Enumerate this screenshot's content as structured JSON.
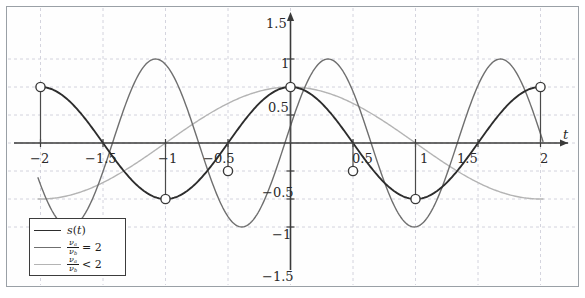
{
  "figure": {
    "background": "#ffffff",
    "frame_color": "#9aa0a6",
    "grid_color": "#c9c9d6",
    "axis_color": "#3a3a3a"
  },
  "axes": {
    "x_axis_label": "t",
    "y_axis_label": "",
    "x_ticks": [
      {
        "value": -2,
        "label": "−2"
      },
      {
        "value": -1.5,
        "label": "−1.5"
      },
      {
        "value": -1,
        "label": "−1"
      },
      {
        "value": -0.5,
        "label": "−0.5"
      },
      {
        "value": 0.5,
        "label": "0.5"
      },
      {
        "value": 1,
        "label": "1"
      },
      {
        "value": 1.5,
        "label": "1.5"
      },
      {
        "value": 2,
        "label": "2"
      }
    ],
    "y_ticks": [
      {
        "value": 1.5,
        "label": "1.5"
      },
      {
        "value": 1,
        "label": "1"
      },
      {
        "value": 0.5,
        "label": "0.5"
      },
      {
        "value": -0.5,
        "label": "−0.5"
      },
      {
        "value": -1,
        "label": "−1"
      },
      {
        "value": -1.5,
        "label": "−1.5"
      }
    ]
  },
  "legend": {
    "position": "bottom-left",
    "entries": [
      {
        "label": "s(t)",
        "kind": "italic",
        "color": "#2d2d2d",
        "width": 1.9
      },
      {
        "label": "ν_a/ν_b = 2",
        "kind": "fraction",
        "numerator": "ν",
        "num_sub": "a",
        "denominator": "ν",
        "den_sub": "b",
        "relation": "= 2",
        "color": "#6f6f6f",
        "width": 1.4
      },
      {
        "label": "ν_a/ν_b < 2",
        "kind": "fraction",
        "numerator": "ν",
        "num_sub": "a",
        "denominator": "ν",
        "den_sub": "b",
        "relation": "< 2",
        "color": "#b4b4b4",
        "width": 1.4
      }
    ]
  },
  "chart_data": {
    "type": "line",
    "title": "",
    "xlabel": "t",
    "ylabel": "",
    "xlim": [
      -2.25,
      2.3
    ],
    "ylim": [
      -1.72,
      1.72
    ],
    "grid": true,
    "grid_style": "dashed",
    "legend_position": "lower left",
    "series": [
      {
        "name": "s(t)",
        "color": "#2d2d2d",
        "linewidth": 1.9,
        "formula": "cos(pi*t)",
        "amplitude": 1,
        "period": 2,
        "x": [
          -2,
          -1.75,
          -1.5,
          -1.25,
          -1,
          -0.75,
          -0.5,
          -0.25,
          0,
          0.25,
          0.5,
          0.75,
          1,
          1.25,
          1.5,
          1.75,
          2
        ],
        "y": [
          1,
          0.707,
          0,
          -0.707,
          -1,
          -0.707,
          0,
          0.707,
          1,
          0.707,
          0,
          -0.707,
          -1,
          -0.707,
          0,
          0.707,
          1
        ]
      },
      {
        "name": "nu_a/nu_b = 2",
        "color": "#6f6f6f",
        "linewidth": 1.4,
        "formula": "1.5*sin(pi*(t-0.3)*1.45)",
        "amplitude": 1.5,
        "x": [
          -2,
          -1.7,
          -1.4,
          -1.1,
          -0.8,
          -0.5,
          -0.2,
          0,
          0.3,
          0.6,
          0.9,
          1.2,
          1.5,
          1.8,
          2
        ],
        "y": [
          1.0,
          1.5,
          0.95,
          -0.3,
          -1.35,
          -1.45,
          -0.35,
          1.0,
          1.5,
          0.95,
          -0.3,
          -1.35,
          -1.45,
          -0.35,
          1.0
        ]
      },
      {
        "name": "nu_a/nu_b < 2",
        "color": "#b4b4b4",
        "linewidth": 1.4,
        "formula": "cos(pi*t/2)",
        "amplitude": 1,
        "period": 4,
        "x": [
          -2,
          -1.75,
          -1.5,
          -1.25,
          -1,
          -0.75,
          -0.5,
          -0.25,
          0,
          0.25,
          0.5,
          0.75,
          1,
          1.25,
          1.5,
          1.75,
          2
        ],
        "y": [
          -1,
          -0.924,
          -0.707,
          -0.383,
          0,
          0.383,
          0.707,
          0.924,
          1,
          0.924,
          0.707,
          0.383,
          0,
          -0.383,
          -0.707,
          -0.924,
          -1
        ]
      }
    ],
    "markers": {
      "name": "sample-points",
      "style": "open-circle",
      "edge_color": "#3a3a3a",
      "face_color": "#ffffff",
      "stems": true,
      "points": [
        {
          "x": -2,
          "y": 1
        },
        {
          "x": -1,
          "y": -1
        },
        {
          "x": -0.5,
          "y": -0.5
        },
        {
          "x": 0,
          "y": 1
        },
        {
          "x": 0.5,
          "y": -0.5
        },
        {
          "x": 1,
          "y": -1
        },
        {
          "x": 2,
          "y": 1
        }
      ]
    }
  }
}
